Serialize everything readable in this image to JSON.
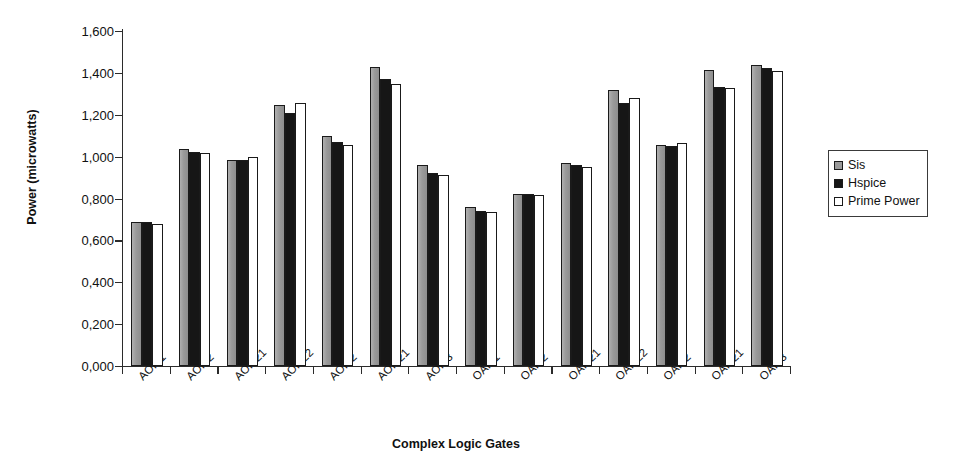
{
  "chart_data": {
    "type": "bar",
    "title": "",
    "xlabel": "Complex Logic Gates",
    "ylabel": "Power (microwatts)",
    "ylim": [
      0,
      1.6
    ],
    "ytick_step": 0.2,
    "ytick_labels": [
      "1,600",
      "1,400",
      "1,200",
      "1,000",
      "0,800",
      "0,600",
      "0,400",
      "0,200",
      "0,000"
    ],
    "ytick_values": [
      1.6,
      1.4,
      1.2,
      1.0,
      0.8,
      0.6,
      0.4,
      0.2,
      0.0
    ],
    "grid": false,
    "legend_position": "right",
    "categories": [
      "AOI21",
      "AOI22",
      "AOI221",
      "AOI222",
      "AOI32",
      "AOI321",
      "AOI33",
      "OAI21",
      "OAI22",
      "OAI221",
      "OAI222",
      "OAI32",
      "OAI321",
      "OAI33"
    ],
    "series": [
      {
        "name": "Sis",
        "color": "#9a9a9a",
        "values": [
          0.69,
          1.035,
          0.985,
          1.245,
          1.1,
          1.43,
          0.96,
          0.76,
          0.822,
          0.968,
          1.32,
          1.055,
          1.412,
          1.44
        ]
      },
      {
        "name": "Hspice",
        "color": "#161616",
        "values": [
          0.688,
          1.022,
          0.982,
          1.21,
          1.072,
          1.37,
          0.92,
          0.742,
          0.82,
          0.962,
          1.258,
          1.052,
          1.332,
          1.425
        ]
      },
      {
        "name": "Prime Power",
        "color": "#ffffff",
        "values": [
          0.68,
          1.015,
          1.0,
          1.255,
          1.055,
          1.345,
          0.912,
          0.735,
          0.815,
          0.95,
          1.282,
          1.065,
          1.33,
          1.408
        ]
      }
    ]
  },
  "legend": {
    "items": [
      {
        "label": "Sis"
      },
      {
        "label": "Hspice"
      },
      {
        "label": "Prime Power"
      }
    ]
  }
}
